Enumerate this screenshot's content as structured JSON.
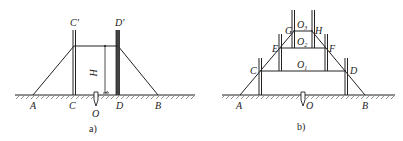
{
  "figure_a": {
    "caption": "a)",
    "labels": {
      "A": "A",
      "B": "B",
      "C": "C",
      "D": "D",
      "C_prime": "C'",
      "D_prime": "D'",
      "O": "O",
      "H": "H"
    }
  },
  "figure_b": {
    "caption": "b)",
    "labels": {
      "A": "A",
      "B": "B",
      "C": "C",
      "D": "D",
      "E": "E",
      "F": "F",
      "G": "G",
      "H": "H",
      "O": "O",
      "O1_main": "O",
      "O1_sub": "1",
      "O2_main": "O",
      "O2_sub": "2",
      "O3_main": "O",
      "O3_sub": "3"
    }
  },
  "colors": {
    "line": "#222222",
    "hatch": "#555555",
    "background": "#ffffff"
  }
}
